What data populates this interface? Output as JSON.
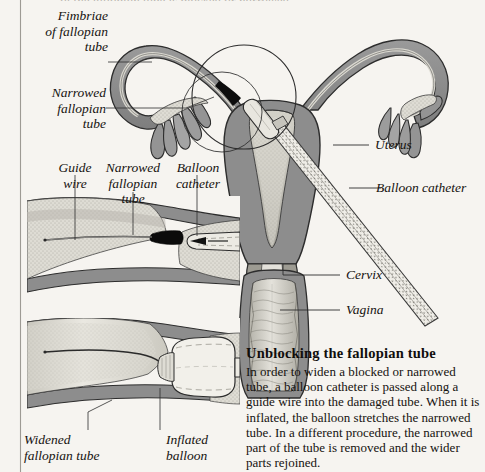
{
  "figure": {
    "background_color": "#f6f4f0",
    "ink_color": "#15120f",
    "tissue_outer_color": "#8d8d8d",
    "tissue_inner_color": "#d9d7ce",
    "blockage_color": "#0d0d0d"
  },
  "top_cut_text": "of the fallopian tube is blocked or narrowed",
  "labels": {
    "fimbriae": "Fimbriae\nof fallopian\ntube",
    "narrowed_upper": "Narrowed\nfallopian\ntube",
    "guide_wire": "Guide\nwire",
    "narrowed_panel": "Narrowed\nfallopian\ntube",
    "balloon_catheter_panel": "Balloon\ncatheter",
    "widened": "Widened\nfallopian tube",
    "inflated_balloon": "Inflated\nballoon",
    "uterus": "Uterus",
    "balloon_catheter": "Balloon catheter",
    "cervix": "Cervix",
    "vagina": "Vagina"
  },
  "caption": {
    "heading": "Unblocking the fallopian tube",
    "paragraph": "In order to widen a blocked or narrowed tube, a balloon catheter is passed along a guide wire into the damaged tube. When it is inflated, the balloon stretches the narrowed tube. In a different procedure, the narrowed part of the tube is removed and the wider parts rejoined."
  }
}
